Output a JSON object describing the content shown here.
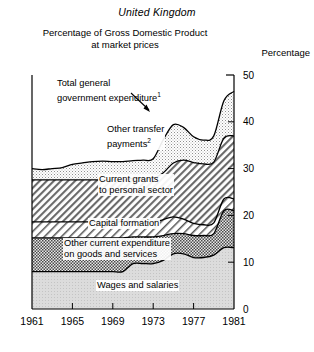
{
  "header": {
    "country": "United Kingdom",
    "subtitle_line1": "Percentage of Gross Domestic Product",
    "subtitle_line2": "at market prices",
    "yaxis_title": "Percentage"
  },
  "annotations": {
    "total": "Total general\ngovernment expenditure",
    "total_note": "1",
    "transfer": "Other transfer\npayments",
    "transfer_note": "2",
    "grants": "Current grants\nto personal sector",
    "capital": "Capital formation",
    "othercurrent": "Other current expenditure\non goods and services",
    "wages": "Wages and salaries"
  },
  "chart_data": {
    "type": "area",
    "title": "Percentage of Gross Domestic Product at market prices",
    "subtitle": "United Kingdom",
    "xlabel": "",
    "ylabel": "Percentage",
    "xlim": [
      1961,
      1981
    ],
    "ylim": [
      0,
      50
    ],
    "yticks": [
      0,
      10,
      20,
      30,
      40,
      50
    ],
    "xticks": [
      1961,
      1965,
      1969,
      1973,
      1977,
      1981
    ],
    "grid": false,
    "legend": "inline-annotations",
    "stacked": true,
    "x": [
      1961,
      1962,
      1963,
      1964,
      1965,
      1966,
      1967,
      1968,
      1969,
      1970,
      1971,
      1972,
      1973,
      1974,
      1975,
      1976,
      1977,
      1978,
      1979,
      1980,
      1981
    ],
    "series": [
      {
        "name": "Wages and salaries",
        "fill": "light-grey-stipple",
        "values": [
          8.0,
          8.0,
          8.0,
          8.0,
          8.0,
          8.0,
          8.0,
          8.0,
          8.0,
          8.0,
          9.7,
          9.7,
          9.7,
          10.4,
          11.8,
          11.8,
          11.0,
          11.0,
          11.5,
          13.1,
          13.1
        ]
      },
      {
        "name": "Other current expenditure on goods and services",
        "fill": "dark-checker",
        "values": [
          7.2,
          7.2,
          7.2,
          7.2,
          7.2,
          7.2,
          7.2,
          7.2,
          7.2,
          7.2,
          5.7,
          5.7,
          5.7,
          5.3,
          4.3,
          4.3,
          4.7,
          4.7,
          4.6,
          7.9,
          7.9
        ]
      },
      {
        "name": "Capital formation",
        "fill": "white-hatch",
        "values": [
          3.4,
          3.4,
          3.4,
          3.4,
          3.4,
          3.4,
          3.4,
          3.4,
          3.4,
          3.4,
          3.1,
          3.1,
          3.1,
          3.4,
          3.6,
          3.1,
          2.6,
          2.3,
          2.3,
          2.5,
          2.5
        ]
      },
      {
        "name": "Current grants to personal sector",
        "fill": "grey-hatch",
        "values": [
          9.0,
          9.0,
          9.0,
          9.0,
          9.0,
          9.0,
          9.0,
          9.0,
          9.0,
          9.0,
          9.4,
          9.4,
          9.4,
          10.0,
          11.5,
          12.6,
          13.0,
          13.0,
          13.0,
          13.0,
          13.5
        ]
      },
      {
        "name": "Other transfer payments",
        "fill": "light-stipple",
        "values": [
          2.4,
          2.2,
          2.4,
          2.6,
          3.3,
          3.6,
          3.9,
          4.0,
          3.9,
          3.9,
          3.8,
          3.9,
          4.2,
          7.1,
          8.2,
          7.0,
          5.5,
          5.1,
          5.6,
          8.0,
          9.5
        ]
      }
    ],
    "total_line": {
      "name": "Total general government expenditure",
      "values": [
        30.0,
        29.8,
        30.0,
        30.2,
        30.9,
        31.2,
        31.5,
        31.6,
        31.5,
        31.5,
        31.7,
        31.8,
        32.1,
        36.2,
        39.4,
        38.8,
        36.8,
        36.1,
        37.0,
        44.5,
        46.5
      ]
    },
    "footnotes": [
      "1",
      "2"
    ]
  }
}
